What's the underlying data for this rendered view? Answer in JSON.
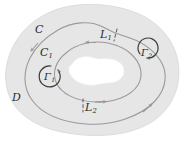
{
  "figure": {
    "width": 185,
    "height": 141,
    "background_color": "#ffffff",
    "region_fill_color": "#e6e6e6",
    "hole_fill_color": "#ffffff",
    "curve_color": "#9a9a9a",
    "label_color": "#2b2b2b",
    "dash_color": "#4a4a4a"
  },
  "labels": {
    "outer_contour": {
      "base": "C",
      "sub": ""
    },
    "inner_contour": {
      "base": "C",
      "sub": "1"
    },
    "cut_upper": {
      "base": "L",
      "sub": "1"
    },
    "cut_lower": {
      "base": "L",
      "sub": "2"
    },
    "gamma_one": {
      "base": "Γ",
      "sub": "1"
    },
    "gamma_two": {
      "base": "Γ",
      "sub": "2"
    },
    "domain": {
      "base": "D",
      "sub": ""
    }
  },
  "elements": {
    "region": "shaded-annular-domain",
    "hole": "irregular-white-hole",
    "outer_curve": "outer-contour-C",
    "inner_curve": "inner-contour-C1",
    "cut_line_upper": "dashed-crosscut-L1",
    "cut_line_lower": "dashed-crosscut-L2",
    "circle_gamma1": "small-circle-gamma1-counterclockwise",
    "circle_gamma2": "small-circle-gamma2-clockwise",
    "arrowheads": [
      "outer-curve-arrow-upper-left-down",
      "outer-curve-arrow-lower-right-up",
      "inner-curve-arrow-top-left",
      "inner-curve-arrow-bottom-right",
      "gamma1-arrow-counterclockwise",
      "gamma2-arrow-clockwise"
    ]
  }
}
